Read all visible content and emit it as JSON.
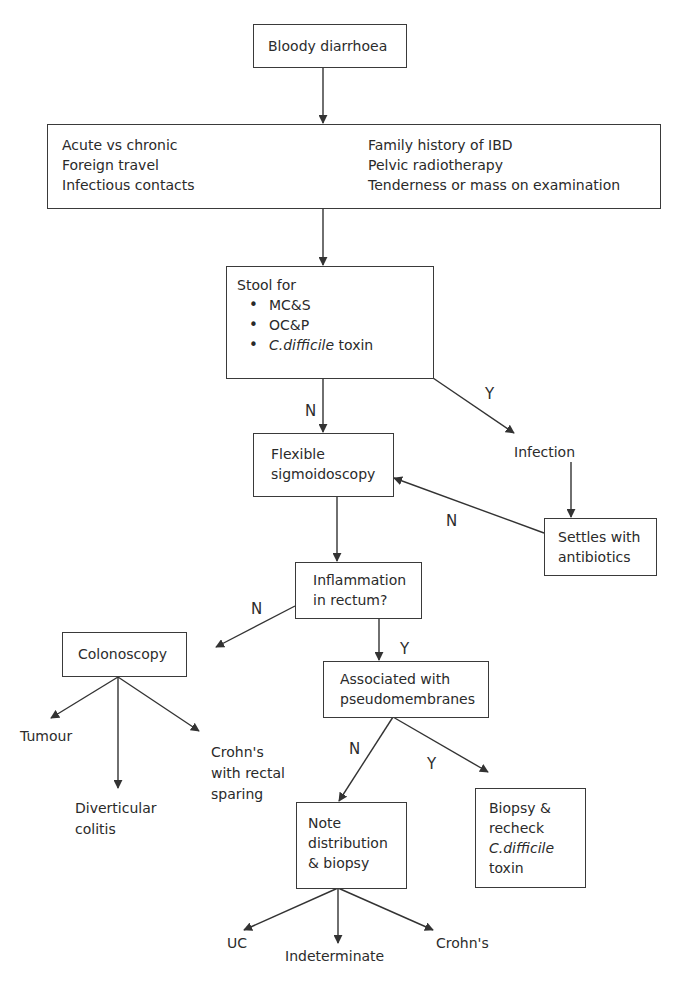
{
  "diagram": {
    "type": "clinical-flowchart",
    "nodes": {
      "start": {
        "text": "Bloody diarrhoea"
      },
      "history": {
        "left": [
          "Acute vs chronic",
          "Foreign travel",
          "Infectious contacts"
        ],
        "right": [
          "Family history of IBD",
          "Pelvic radiotherapy",
          "Tenderness or mass on examination"
        ]
      },
      "stool": {
        "title": "Stool for",
        "items": [
          "MC&S",
          "OC&P"
        ],
        "item3_italic": "C.difficile",
        "item3_rest": " toxin"
      },
      "flex_sig": {
        "line1": "Flexible",
        "line2": "sigmoidoscopy"
      },
      "infection": {
        "text": "Infection"
      },
      "settles": {
        "line1": "Settles with",
        "line2": "antibiotics"
      },
      "inflammation": {
        "line1": "Inflammation",
        "line2": "in rectum?"
      },
      "colonoscopy": {
        "text": "Colonoscopy"
      },
      "tumour": {
        "text": "Tumour"
      },
      "diverticular": {
        "line1": "Diverticular",
        "line2": "colitis"
      },
      "crohns_rectal": {
        "line1": "Crohn's",
        "line2": "with rectal",
        "line3": "sparing"
      },
      "associated": {
        "line1": "Associated with",
        "line2": "pseudomembranes"
      },
      "note": {
        "line1": "Note",
        "line2": "distribution",
        "line3": "& biopsy"
      },
      "biopsy": {
        "line1": "Biopsy &",
        "line2": "recheck",
        "line3_italic": "C.difficile",
        "line4": "toxin"
      },
      "uc": {
        "text": "UC"
      },
      "indeterminate": {
        "text": "Indeterminate"
      },
      "crohns": {
        "text": "Crohn's"
      }
    },
    "edge_labels": {
      "stool_no": "N",
      "stool_yes": "Y",
      "settles_no": "N",
      "inflammation_no": "N",
      "inflammation_yes": "Y",
      "associated_no": "N",
      "associated_yes": "Y"
    },
    "colors": {
      "line": "#333333",
      "text": "#2c2c2c",
      "background": "#ffffff"
    }
  }
}
